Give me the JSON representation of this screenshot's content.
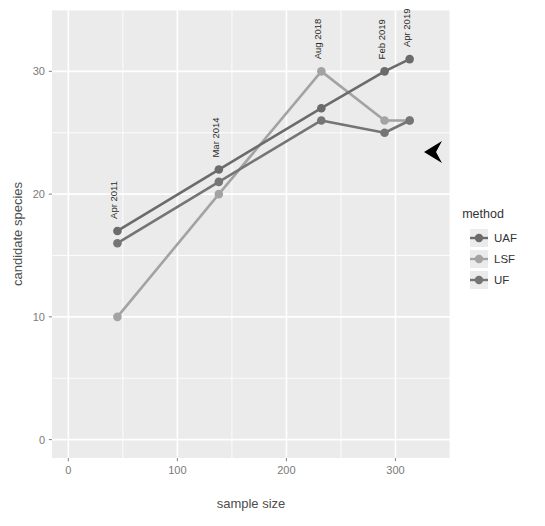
{
  "chart_data": {
    "type": "line",
    "title": "",
    "xlabel": "sample size",
    "ylabel": "candidate species",
    "xlim": [
      -15,
      350
    ],
    "ylim": [
      -1.5,
      35
    ],
    "xticks": [
      0,
      100,
      200,
      300
    ],
    "xtick_labels": [
      "0",
      "100",
      "200",
      "300"
    ],
    "yticks": [
      0,
      10,
      20,
      30
    ],
    "ytick_labels": [
      "0",
      "10",
      "20",
      "30"
    ],
    "grid": true,
    "legend_position": "right",
    "legend_title": "method",
    "series": [
      {
        "name": "UAF",
        "color": "#6b6b6b",
        "x": [
          45,
          138,
          232,
          290,
          313
        ],
        "y": [
          17,
          22,
          27,
          30,
          31
        ]
      },
      {
        "name": "LSF",
        "color": "#a3a3a3",
        "x": [
          45,
          138,
          232,
          290,
          313
        ],
        "y": [
          10,
          20,
          30,
          26,
          26
        ]
      },
      {
        "name": "UF",
        "color": "#757575",
        "x": [
          45,
          138,
          232,
          290,
          313
        ],
        "y": [
          16,
          21,
          26,
          25,
          26
        ]
      }
    ],
    "annotations": [
      {
        "text": "Apr 2011",
        "x": 45,
        "y": 17,
        "rotation": -90
      },
      {
        "text": "Mar 2014",
        "x": 138,
        "y": 22,
        "rotation": -90
      },
      {
        "text": "Aug 2018",
        "x": 232,
        "y": 30,
        "rotation": -90
      },
      {
        "text": "Feb 2019",
        "x": 290,
        "y": 30,
        "rotation": -90
      },
      {
        "text": "Apr 2019",
        "x": 313,
        "y": 31,
        "rotation": -90
      }
    ]
  },
  "legend": {
    "title": "method",
    "entries": [
      {
        "label": "UAF",
        "color": "#6b6b6b"
      },
      {
        "label": "LSF",
        "color": "#a3a3a3"
      },
      {
        "label": "UF",
        "color": "#757575"
      }
    ]
  },
  "axes": {
    "x_title": "sample size",
    "y_title": "candidate species",
    "x_ticks": [
      "0",
      "100",
      "200",
      "300"
    ],
    "y_ticks": [
      "0",
      "10",
      "20",
      "30"
    ]
  },
  "cursor": {
    "icon": "mouse-pointer-left-arrow",
    "x": 442,
    "y": 152,
    "color": "#000000"
  },
  "theme": {
    "panel_background": "#ebebeb",
    "gridline_color": "#ffffff",
    "page_background": "#ffffff",
    "tick_text_color": "#7a7a7a",
    "axis_title_color": "#4d4d4d"
  }
}
